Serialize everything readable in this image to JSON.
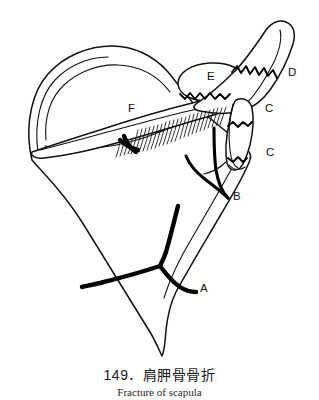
{
  "figure": {
    "number": "149",
    "title_cn": "149．肩胛骨骨折",
    "title_en": "Fracture of scapula",
    "subject": "scapula",
    "view": "posterior-oblique",
    "line_color": "#111111",
    "fracture_color": "#000000",
    "background_color": "#ffffff"
  },
  "labels": [
    {
      "id": "A",
      "text": "A",
      "x": 200,
      "y": 292,
      "region": "scapular-body-fracture"
    },
    {
      "id": "B",
      "text": "B",
      "x": 233,
      "y": 200,
      "region": "scapular-neck-fracture"
    },
    {
      "id": "C1",
      "text": "C",
      "x": 265,
      "y": 112,
      "region": "glenoid-fracture-upper"
    },
    {
      "id": "C2",
      "text": "C",
      "x": 266,
      "y": 156,
      "region": "glenoid-fracture-lower"
    },
    {
      "id": "D",
      "text": "D",
      "x": 288,
      "y": 76,
      "region": "coracoid-process-fracture"
    },
    {
      "id": "E",
      "text": "E",
      "x": 207,
      "y": 80,
      "region": "acromion-fracture"
    },
    {
      "id": "F",
      "text": "F",
      "x": 128,
      "y": 112,
      "region": "scapular-spine-fracture"
    }
  ],
  "caption": {
    "chinese": "149．肩胛骨骨折",
    "english": "Fracture of scapula"
  }
}
